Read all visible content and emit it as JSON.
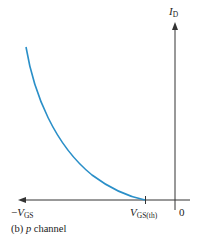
{
  "diagram": {
    "caption_prefix": "(b) ",
    "caption_italic": "p",
    "caption_suffix": " channel",
    "y_axis": {
      "symbol": "I",
      "subscript": "D"
    },
    "x_axis_left": {
      "prefix": "−",
      "symbol": "V",
      "subscript": "GS"
    },
    "threshold": {
      "symbol": "V",
      "subscript": "GS(th)"
    },
    "origin_label": "0",
    "colors": {
      "curve": "#2a8fc8",
      "axis": "#333333"
    }
  }
}
